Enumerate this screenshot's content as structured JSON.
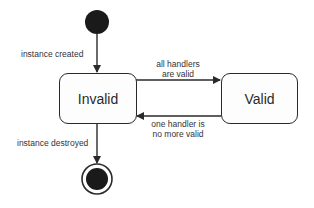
{
  "diagram": {
    "type": "state-machine",
    "states": [
      {
        "id": "initial",
        "kind": "initial"
      },
      {
        "id": "invalid",
        "label": "Invalid"
      },
      {
        "id": "valid",
        "label": "Valid"
      },
      {
        "id": "final",
        "kind": "final"
      }
    ],
    "transitions": [
      {
        "from": "initial",
        "to": "invalid",
        "label": "instance created"
      },
      {
        "from": "invalid",
        "to": "valid",
        "label_line1": "all handlers",
        "label_line2": "are valid"
      },
      {
        "from": "valid",
        "to": "invalid",
        "label_line1": "one handler is",
        "label_line2": "no more valid"
      },
      {
        "from": "invalid",
        "to": "final",
        "label": "instance destroyed"
      }
    ],
    "colors": {
      "stroke": "#2a2a2a",
      "fill_node": "#1a1a1a",
      "box_fill": "#fdfdfd"
    }
  }
}
